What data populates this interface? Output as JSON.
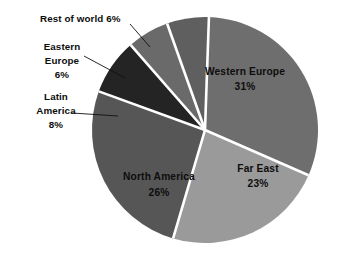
{
  "chart_data": {
    "type": "pie",
    "title": "",
    "subtitle": "",
    "xlabel": "",
    "ylabel": "",
    "legend_position": "none",
    "grid": false,
    "units": "percent",
    "categories": [
      "Western Europe",
      "Far East",
      "North America",
      "Latin America",
      "Eastern Europe",
      "Rest of world"
    ],
    "values": [
      31,
      23,
      26,
      8,
      6,
      6
    ],
    "slices": [
      {
        "name": "Western Europe",
        "label": "Western Europe",
        "percent": 31,
        "percent_text": "31%",
        "color": "#6e6e6e",
        "label_placement": "inside",
        "label_x": 245,
        "label_y": 75,
        "pct_x": 245,
        "pct_y": 90
      },
      {
        "name": "Far East",
        "label": "Far East",
        "percent": 23,
        "percent_text": "23%",
        "color": "#9a9a9a",
        "label_placement": "inside",
        "label_x": 258,
        "label_y": 172,
        "pct_x": 258,
        "pct_y": 187
      },
      {
        "name": "North America",
        "label": "North America",
        "percent": 26,
        "percent_text": "26%",
        "color": "#565656",
        "label_placement": "inside",
        "label_x": 159,
        "label_y": 180,
        "pct_x": 159,
        "pct_y": 196
      },
      {
        "name": "Latin America",
        "label": "Latin America",
        "percent": 8,
        "percent_text": "8%",
        "color": "#242424",
        "label_placement": "outside-left",
        "line1": "Latin",
        "line2": "America",
        "line3": "8%",
        "label_x": 56,
        "label_y": 100,
        "leader_x1": 72,
        "leader_y1": 113,
        "leader_x2": 118,
        "leader_y2": 116
      },
      {
        "name": "Eastern Europe",
        "label": "Eastern Europe",
        "percent": 6,
        "percent_text": "6%",
        "color": "#6a6a6a",
        "label_placement": "outside-left",
        "line1": "Eastern",
        "line2": "Europe",
        "line3": "6%",
        "label_x": 62,
        "label_y": 50,
        "leader_x1": 84,
        "leader_y1": 56,
        "leader_x2": 125,
        "leader_y2": 78
      },
      {
        "name": "Rest of world",
        "label": "Rest of world",
        "percent": 6,
        "percent_text": "6%",
        "color": "#5f5f5f",
        "label_placement": "outside-top",
        "line1": "Rest of world 6%",
        "label_x": 40,
        "label_y": 22,
        "leader_x1": 130,
        "leader_y1": 24,
        "leader_x2": 150,
        "leader_y2": 47
      }
    ],
    "geometry": {
      "center_x": 205,
      "center_y": 130,
      "radius": 113,
      "start_angle_deg": -88,
      "separator_color": "#ffffff",
      "background": "#ffffff"
    }
  }
}
